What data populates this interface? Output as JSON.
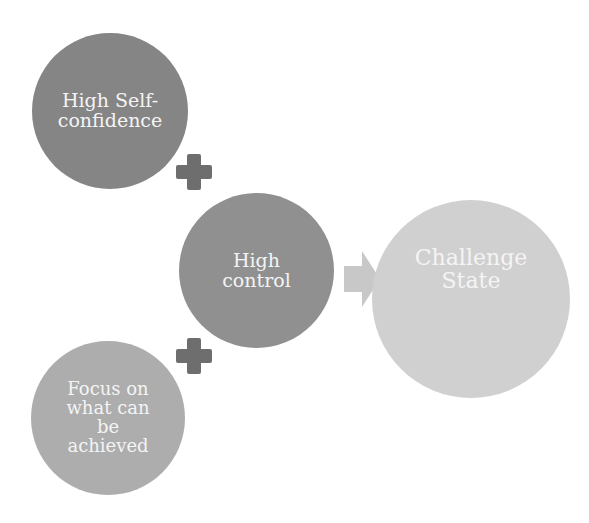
{
  "diagram": {
    "nodes": [
      {
        "id": "self-confidence",
        "label": "High Self-confidence",
        "lines": [
          "High Self-",
          "confidence"
        ],
        "color": "#858585"
      },
      {
        "id": "control",
        "label": "High control",
        "lines": [
          "High",
          "control"
        ],
        "color": "#909090"
      },
      {
        "id": "challenge",
        "label": "Challenge State",
        "lines": [
          "Challenge",
          "State"
        ],
        "color": "#d0d0d0"
      },
      {
        "id": "focus",
        "label": "Focus on what can be achieved",
        "lines": [
          "Focus on",
          "what can",
          "be",
          "achieved"
        ],
        "color": "#adadad"
      }
    ],
    "operators": [
      {
        "type": "plus",
        "between": [
          "self-confidence",
          "control"
        ]
      },
      {
        "type": "plus",
        "between": [
          "control",
          "focus"
        ]
      },
      {
        "type": "arrow",
        "from": "control",
        "to": "challenge"
      }
    ],
    "colors": {
      "plus": "#6e6e6e",
      "arrow": "#c8c8c8",
      "text": "#f4f4f4"
    }
  }
}
